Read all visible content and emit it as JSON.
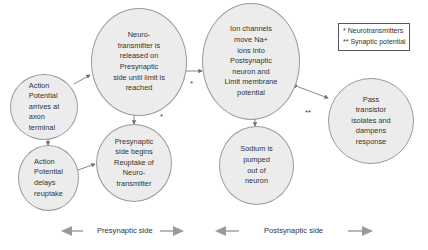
{
  "diagram": {
    "nodes": [
      {
        "id": "action-potential-arrives",
        "label": "Action\nPotential\narrives at\naxon\nterminal"
      },
      {
        "id": "neurotransmitter-released",
        "label": "Neuro-\ntransmitter is\nreleased on\nPresynaptic\nside until limit is\nreached"
      },
      {
        "id": "action-potential-delays",
        "label": "Action\nPotential\ndelays\nreuptake"
      },
      {
        "id": "presynaptic-reuptake",
        "label": "Presynaptic\nside begins\nReuptake of\nNeuro-\ntransmitter"
      },
      {
        "id": "ion-channels",
        "label": "Ion channels\nmove Na+\nions into\nPostsynaptic\nneuron and\nLimit membrane\npotential"
      },
      {
        "id": "pass-transistor",
        "label": "Pass\ntransistor\nisolates and\ndampens\nresponse"
      },
      {
        "id": "sodium-pumped",
        "label": "Sodium is\npumped\nout of\nneuron"
      }
    ],
    "edges": [
      {
        "from": "action-potential-arrives",
        "to": "neurotransmitter-released",
        "marker": ""
      },
      {
        "from": "action-potential-arrives",
        "to": "action-potential-delays",
        "marker": ""
      },
      {
        "from": "action-potential-delays",
        "to": "presynaptic-reuptake",
        "marker": ""
      },
      {
        "from": "neurotransmitter-released",
        "to": "presynaptic-reuptake",
        "marker": "*"
      },
      {
        "from": "neurotransmitter-released",
        "to": "ion-channels",
        "marker": "*"
      },
      {
        "from": "ion-channels",
        "to": "pass-transistor",
        "marker": "**",
        "bidirectional": true
      },
      {
        "from": "ion-channels",
        "to": "sodium-pumped",
        "marker": ""
      }
    ],
    "markers": {
      "edge_b_c": "*",
      "edge_b_e": "*",
      "edge_e_f": "**"
    },
    "legend": {
      "items": [
        {
          "symbol": "*",
          "text": "Neurotransmitters"
        },
        {
          "symbol": "**",
          "text": "Synaptic potential"
        }
      ]
    },
    "sides": {
      "presynaptic": "Presynaptic side",
      "postsynaptic": "Postsynaptic side"
    },
    "colors": {
      "node_fill": "#ececec",
      "node_border": "#9a9a9a",
      "arrow": "#7a7a7a",
      "side_arrow": "#9a9a9a"
    }
  }
}
